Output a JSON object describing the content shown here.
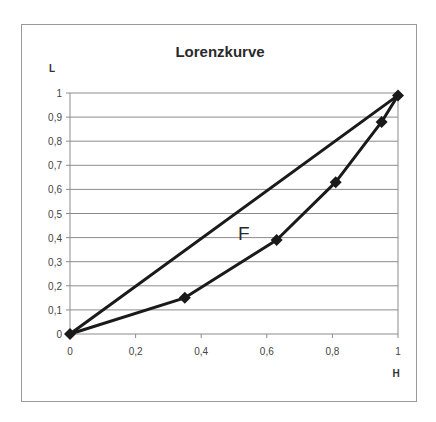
{
  "chart_data": {
    "type": "line",
    "title": "Lorenzkurve",
    "xlabel": "H",
    "ylabel": "L",
    "xlim": [
      0,
      1
    ],
    "ylim": [
      0,
      1
    ],
    "x_ticks": [
      "0",
      "0,2",
      "0,4",
      "0,6",
      "0,8",
      "1"
    ],
    "y_ticks": [
      "0",
      "0,1",
      "0,2",
      "0,3",
      "0,4",
      "0,5",
      "0,6",
      "0,7",
      "0,8",
      "0,9",
      "1"
    ],
    "grid": "horizontal",
    "legend": null,
    "annotations": [
      {
        "text": "F",
        "x": 0.53,
        "y": 0.42
      }
    ],
    "series": [
      {
        "name": "Gleichverteilungsgerade",
        "x": [
          0,
          1
        ],
        "y": [
          0,
          0.99
        ],
        "markers": false
      },
      {
        "name": "Lorenzkurve",
        "x": [
          0,
          0.35,
          0.63,
          0.81,
          0.95,
          1
        ],
        "y": [
          0,
          0.15,
          0.39,
          0.63,
          0.88,
          0.99
        ],
        "markers": true,
        "marker": "diamond"
      }
    ]
  },
  "colors": {
    "line": "#1a1a1a",
    "grid": "#8c8c8c",
    "frame": "#9a9a9a",
    "text": "#333333"
  }
}
